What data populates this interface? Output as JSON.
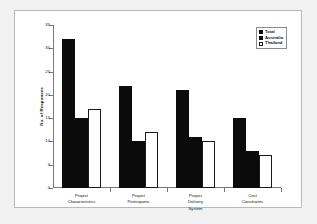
{
  "chart_data": {
    "type": "bar",
    "title": "",
    "subtitle": "",
    "xlabel": "",
    "ylabel": "No. of Responses",
    "ylim": [
      0,
      35
    ],
    "ytick_step": 5,
    "yticks": [
      0,
      5,
      10,
      15,
      20,
      25,
      30,
      35
    ],
    "grid": false,
    "legend_position": "top-right",
    "categories": [
      "Project\nCharacteristics",
      "Project\nParticipants",
      "Project\nDelivery\nSystem",
      "Cost\nConstraints"
    ],
    "series": [
      {
        "name": "Total",
        "values": [
          32,
          22,
          21,
          15
        ],
        "color": "#0b0b0b",
        "style": "filled"
      },
      {
        "name": "Australia",
        "values": [
          15,
          10,
          11,
          8
        ],
        "color": "#0b0b0b",
        "style": "filled"
      },
      {
        "name": "Thailand",
        "values": [
          17,
          12,
          10,
          7
        ],
        "color": "#ffffff",
        "style": "hollow"
      }
    ]
  },
  "legend": {
    "items": [
      {
        "label": "Total",
        "style": "filled"
      },
      {
        "label": "Australia",
        "style": "filled"
      },
      {
        "label": "Thailand",
        "style": "hollow"
      }
    ]
  },
  "colors": {
    "figure_background": "#f2f2f2",
    "panel_background": "#ffffff",
    "panel_border": "#b9b9b9",
    "axis": "#7a7a7a",
    "text": "#111111",
    "bar_fill": "#0b0b0b",
    "bar_outline": "#1a1a1a"
  }
}
